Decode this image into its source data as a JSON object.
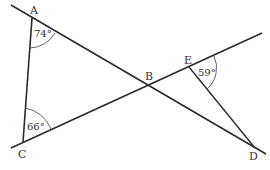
{
  "diagram": {
    "type": "geometry",
    "stroke_color": "#2b2b2b",
    "points": {
      "A": {
        "label": "A",
        "x": 32,
        "y": 18
      },
      "B": {
        "label": "B",
        "x": 147,
        "y": 86
      },
      "C": {
        "label": "C",
        "x": 23,
        "y": 142
      },
      "D": {
        "label": "D",
        "x": 255,
        "y": 148
      },
      "E": {
        "label": "E",
        "x": 189,
        "y": 67
      }
    },
    "lines": [
      {
        "name": "line-ABD",
        "through": [
          "A",
          "B",
          "D"
        ]
      },
      {
        "name": "line-CBE",
        "through": [
          "C",
          "B",
          "E"
        ]
      }
    ],
    "segments": [
      {
        "name": "segment-AC",
        "from": "A",
        "to": "C"
      },
      {
        "name": "segment-ED",
        "from": "E",
        "to": "D"
      }
    ],
    "angles": [
      {
        "vertex": "A",
        "label": "74°"
      },
      {
        "vertex": "C",
        "label": "66°"
      },
      {
        "vertex": "E",
        "label": "59°"
      }
    ]
  }
}
